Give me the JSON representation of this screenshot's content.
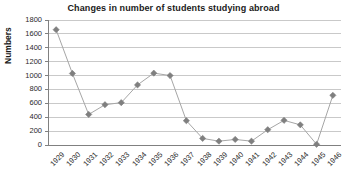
{
  "chart_data": {
    "type": "line",
    "title": "Changes in number of students studying abroad",
    "xlabel": "",
    "ylabel": "Numbers",
    "categories": [
      "1929",
      "1930",
      "1931",
      "1932",
      "1933",
      "1934",
      "1935",
      "1936",
      "1937",
      "1938",
      "1939",
      "1940",
      "1941",
      "1942",
      "1943",
      "1944",
      "1945",
      "1946"
    ],
    "values": [
      1660,
      1030,
      440,
      580,
      610,
      865,
      1035,
      1000,
      350,
      95,
      55,
      80,
      55,
      220,
      355,
      290,
      10,
      715
    ],
    "series": [
      {
        "name": "Numbers",
        "values": [
          1660,
          1030,
          440,
          580,
          610,
          865,
          1035,
          1000,
          350,
          95,
          55,
          80,
          55,
          220,
          355,
          290,
          10,
          715
        ]
      }
    ],
    "ylim": [
      0,
      1800
    ],
    "yticks": [
      0,
      200,
      400,
      600,
      800,
      1000,
      1200,
      1400,
      1600,
      1800
    ],
    "ytick_labels": [
      "0",
      "200",
      "400",
      "600",
      "800",
      "1000",
      "1200",
      "1400",
      "1600",
      "1800"
    ],
    "grid": true,
    "grid_axis": "y",
    "legend": false,
    "legend_position": "none",
    "marker": "diamond",
    "colors": {
      "marker": "#7f7f7f",
      "line": "#a6a6a6",
      "grid": "#c9c9c9",
      "axis": "#808080",
      "text": "#1a1a1a",
      "background": "#ffffff"
    }
  }
}
